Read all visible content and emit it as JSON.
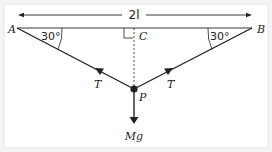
{
  "diagram": {
    "type": "force-diagram",
    "dimension_label": "2l",
    "points": {
      "A": "A",
      "B": "B",
      "C": "C",
      "P": "P"
    },
    "angles": {
      "left": "30°",
      "right": "30°"
    },
    "forces": {
      "tension_left": "T",
      "tension_right": "T",
      "weight": "Mg"
    },
    "colors": {
      "line": "#222222",
      "background": "#ffffff",
      "border": "#e6e6e6"
    }
  }
}
